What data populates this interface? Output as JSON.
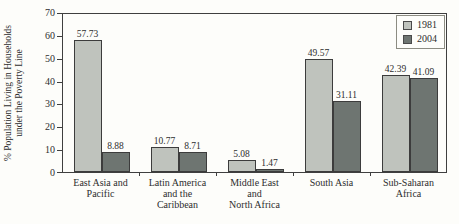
{
  "figure": {
    "background": "#fdfdfa",
    "y_axis_title": "% Population Living in Households\nunder the Poverty Line"
  },
  "chart_data": {
    "type": "bar",
    "title": "",
    "xlabel": "",
    "ylabel": "% Population Living in Households under the Poverty Line",
    "ylim": [
      0,
      70
    ],
    "yticks": [
      0,
      10,
      20,
      30,
      40,
      50,
      60,
      70
    ],
    "grid": false,
    "legend_position": "top-right-inside",
    "value_labels": true,
    "categories": [
      "East Asia and\nPacific",
      "Latin America\nand the\nCaribbean",
      "Middle East\nand\nNorth Africa",
      "South Asia",
      "Sub-Saharan\nAfrica"
    ],
    "series": [
      {
        "name": "1981",
        "color": "#bfc3bd",
        "values": [
          57.73,
          10.77,
          5.08,
          49.57,
          42.39
        ]
      },
      {
        "name": "2004",
        "color": "#6e7571",
        "values": [
          8.88,
          8.71,
          1.47,
          31.11,
          41.09
        ]
      }
    ],
    "axis_color": "#3f3f3f",
    "bar_border_color": "#3c3c3c"
  }
}
